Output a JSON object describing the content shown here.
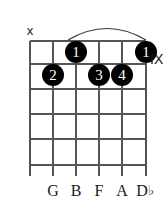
{
  "diagram": {
    "type": "guitar-chord-diagram",
    "strings": 6,
    "frets": 6,
    "position_label": "IX",
    "barre": {
      "present": true,
      "finger": "1",
      "from_string": 3,
      "to_string": 6
    },
    "string_markers": [
      {
        "string": 1,
        "symbol": "x",
        "meaning": "muted"
      }
    ],
    "dots": [
      {
        "string": 3,
        "fret": 1,
        "finger": "1"
      },
      {
        "string": 6,
        "fret": 1,
        "finger": "1"
      },
      {
        "string": 2,
        "fret": 2,
        "finger": "2"
      },
      {
        "string": 4,
        "fret": 2,
        "finger": "3"
      },
      {
        "string": 5,
        "fret": 2,
        "finger": "4"
      }
    ],
    "note_labels": [
      {
        "string": 2,
        "note": "G",
        "accidental": ""
      },
      {
        "string": 3,
        "note": "B",
        "accidental": ""
      },
      {
        "string": 4,
        "note": "F",
        "accidental": ""
      },
      {
        "string": 5,
        "note": "A",
        "accidental": ""
      },
      {
        "string": 6,
        "note": "D",
        "accidental": "♭"
      }
    ],
    "colors": {
      "grid": "#555555",
      "dot_fill": "#000000",
      "dot_text": "#ffffff",
      "text": "#1a1a1a",
      "background": "#ffffff"
    }
  }
}
